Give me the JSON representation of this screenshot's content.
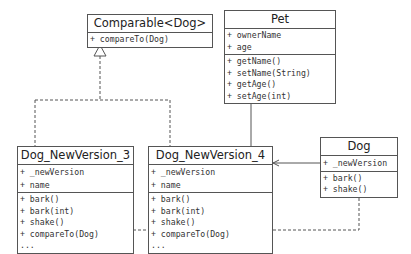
{
  "diagram": {
    "type": "uml-class-diagram",
    "classes": [
      {
        "id": "comparable",
        "name": "Comparable<Dog>",
        "attributes": [],
        "methods": [
          "+ compareTo(Dog)"
        ]
      },
      {
        "id": "pet",
        "name": "Pet",
        "attributes": [
          "+ ownerName",
          "+ age"
        ],
        "methods": [
          "+ getName()",
          "+ setName(String)",
          "+ getAge()",
          "+ setAge(int)"
        ]
      },
      {
        "id": "dog_v3",
        "name": "Dog_NewVersion_3",
        "attributes": [
          "+ _newVersion",
          "+ name"
        ],
        "methods": [
          "+ bark()",
          "+ bark(int)",
          "+ shake()",
          "+ compareTo(Dog)",
          "..."
        ]
      },
      {
        "id": "dog_v4",
        "name": "Dog_NewVersion_4",
        "attributes": [
          "+ _newVersion",
          "+ name"
        ],
        "methods": [
          "+ bark()",
          "+ bark(int)",
          "+ shake()",
          "+ compareTo(Dog)",
          "..."
        ]
      },
      {
        "id": "dog",
        "name": "Dog",
        "attributes": [
          "+ _newVersion"
        ],
        "methods": [
          "+ bark()",
          "+ shake()"
        ]
      }
    ],
    "relations": [
      {
        "from": "dog_v3",
        "to": "comparable",
        "type": "realization",
        "style": "dashed",
        "arrow": "hollow-triangle"
      },
      {
        "from": "dog_v4",
        "to": "comparable",
        "type": "realization",
        "style": "dashed",
        "arrow": "hollow-triangle"
      },
      {
        "from": "dog_v4",
        "to": "pet",
        "type": "generalization",
        "style": "solid",
        "arrow": "hollow-triangle"
      },
      {
        "from": "dog",
        "to": "dog_v4",
        "type": "association",
        "style": "solid",
        "arrow": "open"
      },
      {
        "from": "dog",
        "to": "dog_v3",
        "type": "dependency",
        "style": "dashed",
        "arrow": "open"
      }
    ],
    "colors": {
      "line": "#555555",
      "background": "#ffffff",
      "text": "#333333"
    }
  }
}
